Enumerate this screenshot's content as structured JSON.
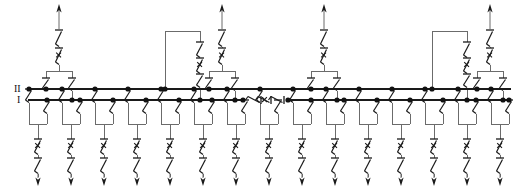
{
  "diagram": {
    "type": "single-line-diagram",
    "width": 517,
    "height": 194,
    "colors": {
      "background": "#ffffff",
      "bus": "#1a1a1a",
      "wire": "#6b6b6b",
      "symbol": "#1a1a1a",
      "node": "#111111",
      "label": "#111111"
    }
  },
  "busbars": [
    {
      "id": "bus-2",
      "label": "II",
      "label_x": 14,
      "label_y": 92,
      "y": 89,
      "x_start": 28,
      "x_end": 511,
      "sectionalized": false
    },
    {
      "id": "bus-1",
      "label": "I",
      "label_x": 17,
      "label_y": 103,
      "y": 100,
      "x_start": 28,
      "x_end": 511,
      "sectionalized": true,
      "section_gap": {
        "x_start": 243,
        "x_end": 288
      }
    }
  ],
  "bus_section_coupler": {
    "name": "bus-1-sectionalizer",
    "orientation": "horizontal",
    "y": 100,
    "x_left_node": 243,
    "x_right_node": 288,
    "disconnector_left": {
      "x": 248,
      "len": 13
    },
    "breaker": {
      "x": 258,
      "len": 13,
      "marker": "x"
    },
    "disconnector_right": {
      "x": 271,
      "len": 13
    }
  },
  "incoming_feeders": [
    {
      "id": "in-1",
      "x": 59,
      "arrow_y": 4,
      "label": "incoming-feeder-1"
    },
    {
      "id": "in-2",
      "x": 222,
      "arrow_y": 4,
      "label": "incoming-feeder-2"
    },
    {
      "id": "in-3",
      "x": 324,
      "arrow_y": 4,
      "label": "incoming-feeder-3"
    },
    {
      "id": "in-4",
      "x": 490,
      "arrow_y": 4,
      "label": "incoming-feeder-4"
    }
  ],
  "incoming_geometry": {
    "line_top": 11,
    "disconnector_y": 30,
    "breaker_y": 48,
    "branch_y": 71,
    "branch_half_width": 13,
    "bus2_ds_y": 78,
    "bus1_ds_y": 90,
    "note": "arrow -> disconnector -> circuit breaker -> split to bus II and bus I"
  },
  "bus_couplers": [
    {
      "id": "coupler-1",
      "bus2_x": 165,
      "top_y": 31,
      "drop_x": 200,
      "label": "bus-coupler-1"
    },
    {
      "id": "coupler-2",
      "bus2_x": 432,
      "top_y": 31,
      "drop_x": 467,
      "label": "bus-coupler-2"
    }
  ],
  "coupler_geometry": {
    "disconnector_y": 42,
    "breaker_y": 58,
    "lower_disconnector_y": 74,
    "note": "bus II riser -> top bridge -> disconnector -> breaker -> disconnector -> bus I"
  },
  "outgoing_feeders": {
    "count": 16,
    "left_group": [
      38,
      71,
      104,
      137,
      170,
      203,
      236,
      269
    ],
    "right_group": [
      302,
      335,
      368,
      401,
      434,
      467,
      500,
      533
    ],
    "geometry": {
      "ds_bus2_y": 89,
      "ds_bus1_y": 100,
      "converge_y": 124,
      "breaker_y": 139,
      "disconnector_y": 158,
      "arrow_y": 186,
      "half_width": 9
    }
  },
  "symbols": {
    "disconnector": "open isolator blade with horizontal contact stub",
    "circuit_breaker": "open isolator blade marked with an x",
    "junction": "filled connection dot",
    "arrow_up": "incoming supply arrow",
    "arrow_down": "outgoing load arrow"
  },
  "legend": {
    "bus_upper": "II",
    "bus_lower": "I"
  }
}
